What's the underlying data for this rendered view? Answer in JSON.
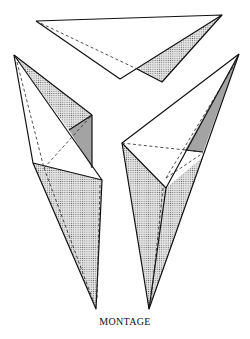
{
  "figure": {
    "caption": "MONTAGE",
    "pieces": [
      {
        "name": "top-piece",
        "description": "flat triangular wedge with shaded face"
      },
      {
        "name": "left-piece",
        "description": "elongated tetrahedral solid pointing down"
      },
      {
        "name": "right-piece",
        "description": "elongated tetrahedral solid pointing down"
      }
    ],
    "colors": {
      "line": "#111111",
      "shade": "#c8c8c8",
      "background": "#ffffff"
    }
  }
}
